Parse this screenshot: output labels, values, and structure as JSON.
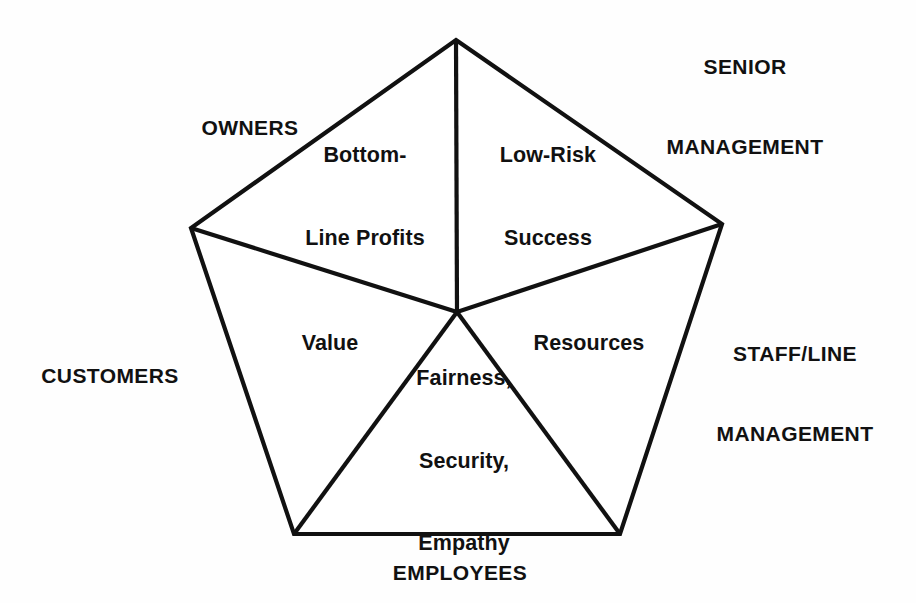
{
  "diagram": {
    "type": "pentagon-stakeholder-model",
    "shape": "pentagon",
    "sector_count": 5,
    "stroke_color": "#111111",
    "fill_color": "#ffffff",
    "background_color": "#fefefe"
  },
  "outer_labels": {
    "owners": "OWNERS",
    "senior_management_line1": "SENIOR",
    "senior_management_line2": "MANAGEMENT",
    "staff_line_management_line1": "STAFF/LINE",
    "staff_line_management_line2": "MANAGEMENT",
    "customers": "CUSTOMERS",
    "employees": "EMPLOYEES"
  },
  "inner_labels": {
    "bottom_line_profits_line1": "Bottom-",
    "bottom_line_profits_line2": "Line Profits",
    "low_risk_success_line1": "Low-Risk",
    "low_risk_success_line2": "Success",
    "value": "Value",
    "resources": "Resources",
    "fairness_line1": "Fairness,",
    "fairness_line2": "Security,",
    "fairness_line3": "Empathy"
  },
  "geometry": {
    "center_x": 457,
    "center_y": 312,
    "vertices": [
      {
        "name": "top",
        "x": 456,
        "y": 40
      },
      {
        "name": "right-upper",
        "x": 722,
        "y": 224
      },
      {
        "name": "bottom-right",
        "x": 620,
        "y": 534
      },
      {
        "name": "bottom-left",
        "x": 294,
        "y": 534
      },
      {
        "name": "left-upper",
        "x": 191,
        "y": 228
      }
    ]
  }
}
